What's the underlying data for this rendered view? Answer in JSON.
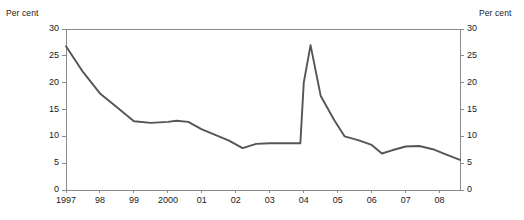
{
  "chart_data": {
    "type": "line",
    "title": "",
    "subtitle": "",
    "xlabel": "",
    "ylabel": "Per cent",
    "ylabel_right": "Per cent",
    "ylim": [
      0,
      30
    ],
    "yticks": [
      0,
      5,
      10,
      15,
      20,
      25,
      30
    ],
    "ytick_labels": [
      "0",
      "5",
      "10",
      "15",
      "20",
      "25",
      "30"
    ],
    "grid": false,
    "legend": "none",
    "xlim": [
      1997.0,
      2008.6
    ],
    "xticks": [
      1997,
      1998,
      1999,
      2000,
      2001,
      2002,
      2003,
      2004,
      2005,
      2006,
      2007,
      2008
    ],
    "xtick_labels": [
      "1997",
      "98",
      "99",
      "2000",
      "01",
      "02",
      "03",
      "04",
      "05",
      "06",
      "07",
      "08"
    ],
    "line_color": "#555555",
    "axis_color": "#8a8a8a",
    "series": [
      {
        "name": "",
        "x": [
          1997.0,
          1997.5,
          1998.0,
          1998.5,
          1999.0,
          1999.5,
          2000.0,
          2000.25,
          2000.6,
          2001.0,
          2001.5,
          2001.8,
          2002.2,
          2002.6,
          2003.0,
          2003.5,
          2003.8,
          2003.9,
          2004.0,
          2004.2,
          2004.5,
          2004.9,
          2005.2,
          2005.6,
          2006.0,
          2006.3,
          2006.6,
          2007.0,
          2007.4,
          2007.8,
          2008.2,
          2008.6
        ],
        "values": [
          26.8,
          22.0,
          18.0,
          15.4,
          12.8,
          12.5,
          12.7,
          12.9,
          12.7,
          11.3,
          10.0,
          9.2,
          7.8,
          8.6,
          8.7,
          8.7,
          8.7,
          8.7,
          20.0,
          27.0,
          17.5,
          13.0,
          10.0,
          9.3,
          8.4,
          6.8,
          7.4,
          8.1,
          8.2,
          7.6,
          6.6,
          5.6
        ]
      }
    ]
  },
  "axes": {
    "unit_label_left": "Per cent",
    "unit_label_right": "Per cent"
  }
}
